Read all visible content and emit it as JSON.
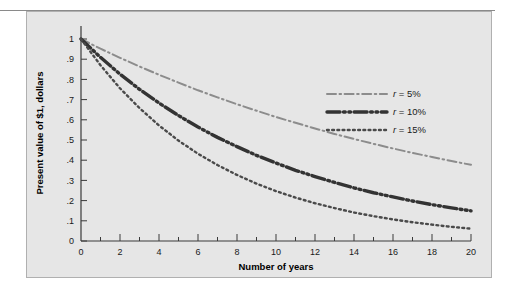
{
  "figure": {
    "panel_background": "#e6e6e6",
    "panel_border": "#b0b0b0"
  },
  "chart_data": {
    "type": "line",
    "title": "",
    "xlabel": "Number of years",
    "ylabel": "Present value of $1, dollars",
    "xlim": [
      0,
      20
    ],
    "ylim": [
      0,
      1
    ],
    "grid": false,
    "legend_position": "upper-right-inside",
    "x_ticks_major": [
      0,
      2,
      4,
      6,
      8,
      10,
      12,
      14,
      16,
      18,
      20
    ],
    "x_tick_labels": [
      "0",
      "2",
      "4",
      "6",
      "8",
      "10",
      "12",
      "14",
      "16",
      "18",
      "20"
    ],
    "x_ticks_minor": [
      1,
      3,
      5,
      7,
      9,
      11,
      13,
      15,
      17,
      19
    ],
    "y_ticks": [
      0,
      0.1,
      0.2,
      0.3,
      0.4,
      0.5,
      0.6,
      0.7,
      0.8,
      0.9,
      1
    ],
    "y_tick_labels": [
      "0",
      ".1",
      ".2",
      ".3",
      ".4",
      ".5",
      ".6",
      ".7",
      ".8",
      ".9",
      "1"
    ],
    "x": [
      0,
      1,
      2,
      3,
      4,
      5,
      6,
      7,
      8,
      9,
      10,
      11,
      12,
      13,
      14,
      15,
      16,
      17,
      18,
      19,
      20
    ],
    "series": [
      {
        "name": "r = 5%",
        "rate": 0.05,
        "color": "#8c8c8c",
        "style": "dash-dot",
        "width": 2,
        "values": [
          1.0,
          0.952,
          0.907,
          0.864,
          0.823,
          0.784,
          0.746,
          0.711,
          0.677,
          0.645,
          0.614,
          0.585,
          0.557,
          0.53,
          0.505,
          0.481,
          0.458,
          0.436,
          0.416,
          0.396,
          0.377
        ]
      },
      {
        "name": "r = 10%",
        "rate": 0.1,
        "color": "#333333",
        "style": "dash-dot-dot",
        "width": 3.4,
        "values": [
          1.0,
          0.909,
          0.826,
          0.751,
          0.683,
          0.621,
          0.564,
          0.513,
          0.467,
          0.424,
          0.386,
          0.35,
          0.319,
          0.29,
          0.263,
          0.239,
          0.218,
          0.198,
          0.18,
          0.164,
          0.149
        ]
      },
      {
        "name": "r = 15%",
        "rate": 0.15,
        "color": "#4a4a4a",
        "style": "dotted",
        "width": 2.4,
        "values": [
          1.0,
          0.87,
          0.756,
          0.658,
          0.572,
          0.497,
          0.432,
          0.376,
          0.327,
          0.284,
          0.247,
          0.215,
          0.187,
          0.163,
          0.141,
          0.123,
          0.107,
          0.093,
          0.081,
          0.07,
          0.061
        ]
      }
    ],
    "legend": [
      {
        "label_r": "r",
        "label_rest": " = 5%"
      },
      {
        "label_r": "r",
        "label_rest": " = 10%"
      },
      {
        "label_r": "r",
        "label_rest": " = 15%"
      }
    ]
  }
}
